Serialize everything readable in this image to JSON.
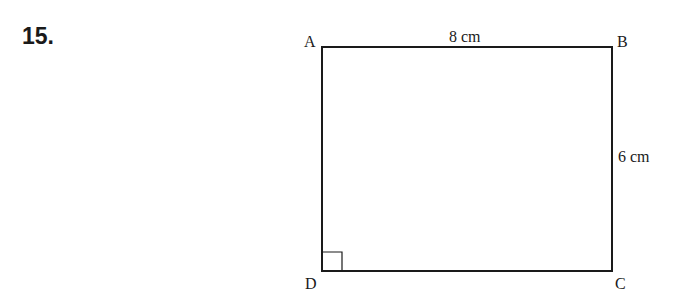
{
  "question": {
    "number": "15."
  },
  "figure": {
    "shape": "rectangle",
    "vertices": {
      "top_left": "A",
      "top_right": "B",
      "bottom_right": "C",
      "bottom_left": "D"
    },
    "labels": {
      "top_side": "8 cm",
      "right_side": "6 cm"
    },
    "right_angle_marker_at": "D",
    "stroke_color": "#1a1a1a"
  }
}
